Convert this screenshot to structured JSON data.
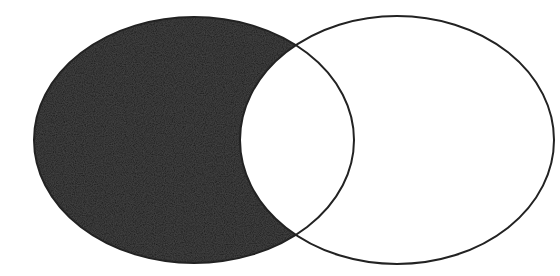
{
  "diagram": {
    "type": "venn",
    "sets": [
      {
        "id": "A",
        "cx": 194,
        "cy": 140,
        "rx": 160,
        "ry": 123,
        "shaded": true
      },
      {
        "id": "B",
        "cx": 397,
        "cy": 140,
        "rx": 157,
        "ry": 124,
        "shaded": false
      }
    ],
    "shaded_region": "A \\ B",
    "colors": {
      "background": "#ffffff",
      "fill": "#1c1c1c",
      "stroke": "#222222"
    },
    "stroke_width": 2
  }
}
